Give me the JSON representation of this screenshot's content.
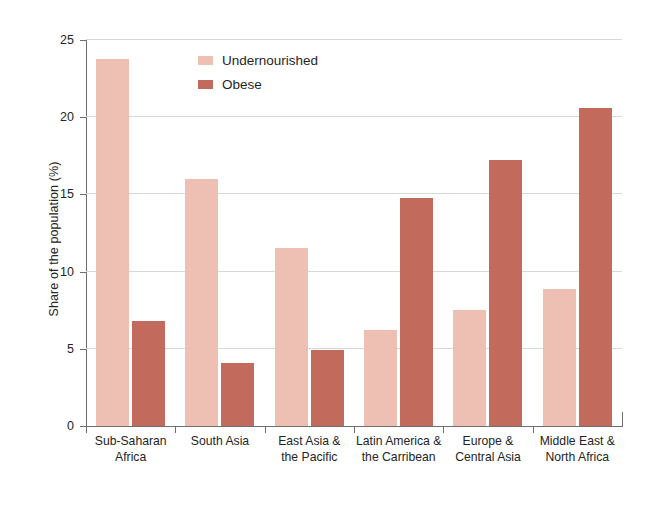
{
  "chart_data": {
    "type": "bar",
    "title": "",
    "subtitle": "",
    "xlabel": "",
    "ylabel": "Share of the population (%)",
    "ylim": [
      0,
      25
    ],
    "yticks": [
      0,
      5,
      10,
      15,
      20,
      25
    ],
    "ytick_labels": [
      "0",
      "5",
      "10",
      "15",
      "20",
      "25"
    ],
    "grid": true,
    "legend_position": "top-center",
    "categories": [
      "Sub-Saharan Africa",
      "South Asia",
      "East Asia & the Pacific",
      "Latin America & the Carribean",
      "Europe & Central Asia",
      "Middle East & North Africa"
    ],
    "category_lines": [
      [
        "Sub-Saharan",
        "Africa"
      ],
      [
        "South Asia"
      ],
      [
        "East Asia &",
        "the Pacific"
      ],
      [
        "Latin America &",
        "the Carribean"
      ],
      [
        "Europe &",
        "Central Asia"
      ],
      [
        "Middle East &",
        "North Africa"
      ]
    ],
    "series": [
      {
        "name": "Undernourished",
        "color": "#edc0b3",
        "values": [
          23.8,
          16.0,
          11.5,
          6.2,
          7.5,
          8.9
        ]
      },
      {
        "name": "Obese",
        "color": "#c26b5c",
        "values": [
          6.8,
          4.1,
          4.9,
          14.8,
          17.2,
          20.6
        ]
      }
    ]
  },
  "legend": {
    "items": [
      {
        "label": "Undernourished",
        "color": "#edc0b3"
      },
      {
        "label": "Obese",
        "color": "#c26b5c"
      }
    ]
  },
  "axis": {
    "y_title": "Share of the population (%)"
  }
}
